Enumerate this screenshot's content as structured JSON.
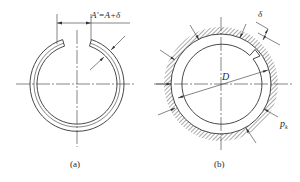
{
  "figure_a": {
    "caption": "(a)",
    "dimension_label": "A'=A+δ"
  },
  "figure_b": {
    "caption": "(b)",
    "diameter_label": "D",
    "thickness_label": "δ",
    "pressure_label": "p",
    "pressure_subscript": "k"
  },
  "colors": {
    "line": "#333333",
    "hatch": "#555555",
    "background": "#ffffff"
  }
}
